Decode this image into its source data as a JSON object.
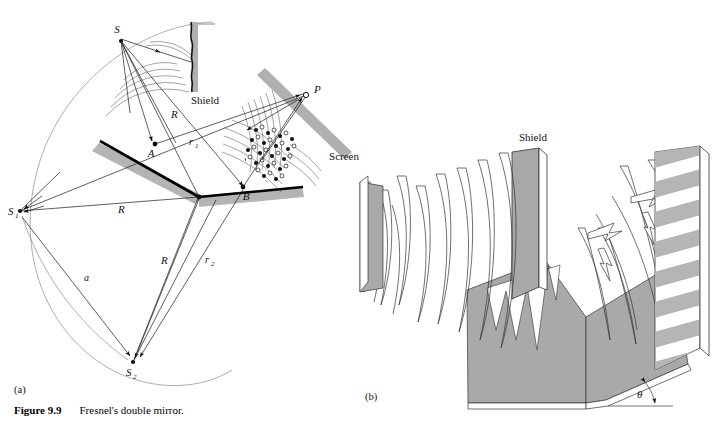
{
  "figure": {
    "number": "Figure 9.9",
    "caption": "Fresnel's double mirror.",
    "panel_a_label": "(a)",
    "panel_b_label": "(b)"
  },
  "panel_a": {
    "labels": {
      "source": "S",
      "image_source_1": "S",
      "image_source_1_sub": "1",
      "image_source_2": "S",
      "image_source_2_sub": "2",
      "mirror_point_a": "A",
      "mirror_point_b": "B",
      "observation_point": "P",
      "shield": "Shield",
      "screen": "Screen",
      "radius_1": "R",
      "radius_2": "R",
      "radius_3": "R",
      "ray_r1": "r",
      "ray_r1_sub": "1",
      "ray_r2": "r",
      "ray_r2_sub": "2",
      "separation": "a"
    }
  },
  "panel_b": {
    "labels": {
      "shield": "Shield",
      "angle": "θ"
    }
  },
  "colors": {
    "ink": "#111111",
    "mirror_shadow": "#b4b4b4",
    "screen_bar": "#b0b0b0",
    "shield_fill": "#a8a8a8",
    "panel_fill": "#a9a9a9",
    "fringe_gray": "#b5b5b5",
    "background": "#ffffff"
  }
}
